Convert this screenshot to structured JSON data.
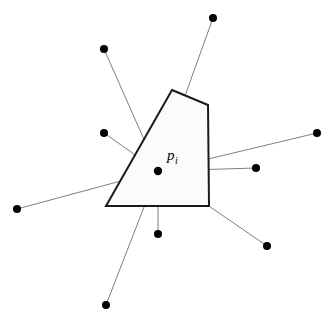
{
  "figure": {
    "canvas": {
      "width": 332,
      "height": 320,
      "background": "#ffffff"
    },
    "colors": {
      "line": "#6f6f70",
      "polygon_stroke": "#1a1a1a",
      "polygon_fill": "#fbfbfb",
      "node": "#000000",
      "label": "#000000"
    },
    "center_point": {
      "id": "p_i",
      "label_base": "p",
      "label_subscript": "i",
      "x": 158,
      "y": 171,
      "radius": 4.2,
      "label_x": 167,
      "label_y": 160
    },
    "polygon": {
      "name": "voronoi-cell",
      "stroke_width": 2.0,
      "points": "172,90 208,105 209,206 106,206",
      "vertices": [
        {
          "x": 172,
          "y": 90
        },
        {
          "x": 208,
          "y": 105
        },
        {
          "x": 209,
          "y": 206
        },
        {
          "x": 106,
          "y": 206
        }
      ]
    },
    "outer_points": [
      {
        "id": "n1",
        "x": 213,
        "y": 18,
        "radius": 4.0
      },
      {
        "id": "n2",
        "x": 104,
        "y": 49,
        "radius": 4.0
      },
      {
        "id": "n3",
        "x": 104,
        "y": 133,
        "radius": 4.0
      },
      {
        "id": "n4",
        "x": 317,
        "y": 133,
        "radius": 4.0
      },
      {
        "id": "n5",
        "x": 256,
        "y": 168,
        "radius": 4.0
      },
      {
        "id": "n6",
        "x": 17,
        "y": 209,
        "radius": 4.0
      },
      {
        "id": "n7",
        "x": 158,
        "y": 234,
        "radius": 4.0
      },
      {
        "id": "n8",
        "x": 267,
        "y": 246,
        "radius": 4.0
      },
      {
        "id": "n9",
        "x": 106,
        "y": 305,
        "radius": 4.0
      }
    ],
    "segments": [
      {
        "id": "s1",
        "from": "p_i",
        "to": "n1",
        "x1": 158,
        "y1": 171,
        "x2": 213,
        "y2": 18
      },
      {
        "id": "s2",
        "from": "p_i",
        "to": "n2",
        "x1": 158,
        "y1": 171,
        "x2": 104,
        "y2": 49
      },
      {
        "id": "s3",
        "from": "p_i",
        "to": "n3",
        "x1": 158,
        "y1": 171,
        "x2": 104,
        "y2": 133
      },
      {
        "id": "s4",
        "from": "p_i",
        "to": "n4",
        "x1": 158,
        "y1": 171,
        "x2": 317,
        "y2": 133
      },
      {
        "id": "s5",
        "from": "p_i",
        "to": "n5",
        "x1": 158,
        "y1": 171,
        "x2": 256,
        "y2": 168
      },
      {
        "id": "s6",
        "from": "p_i",
        "to": "n6",
        "x1": 158,
        "y1": 171,
        "x2": 17,
        "y2": 209
      },
      {
        "id": "s7",
        "from": "p_i",
        "to": "n7",
        "x1": 158,
        "y1": 171,
        "x2": 158,
        "y2": 234
      },
      {
        "id": "s8",
        "from": "p_i",
        "to": "n8",
        "x1": 158,
        "y1": 171,
        "x2": 267,
        "y2": 246
      },
      {
        "id": "s9",
        "from": "p_i",
        "to": "n9",
        "x1": 158,
        "y1": 171,
        "x2": 106,
        "y2": 305
      }
    ]
  }
}
